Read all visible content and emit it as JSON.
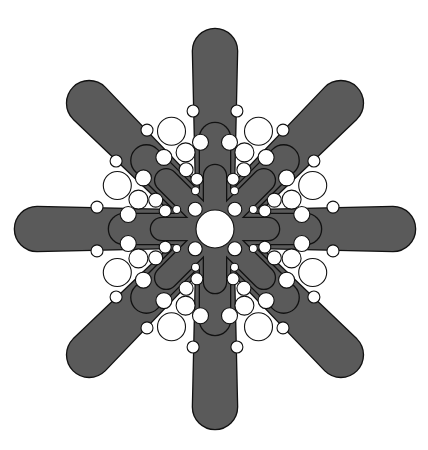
{
  "figure": {
    "title": "Eight-armed star with nested loops and white circle packing",
    "width": 428,
    "height": 450,
    "center": [
      215,
      229
    ],
    "colors": {
      "background": "#ffffff",
      "arm_fill": "#5a5a5a",
      "outline": "#111111",
      "circle_fill": "#ffffff"
    },
    "levels": [
      {
        "name": "outer-arms",
        "axial_length": 200,
        "diagonal_length": 200,
        "tip_width": 44,
        "base_width": 36
      },
      {
        "name": "middle-loops",
        "axial_length": 106,
        "diagonal_length": 112,
        "tip_width": 30,
        "base_width": 30
      },
      {
        "name": "inner-loops",
        "axial_length": 64,
        "diagonal_length": 80,
        "tip_width": 22,
        "base_width": 22
      }
    ],
    "center_circle": {
      "r": 19
    },
    "inner_ring": {
      "d": 28,
      "r": 7
    },
    "gap_chain": [
      {
        "d": 107,
        "da": 1.5,
        "r": 14
      },
      {
        "d": 82,
        "da": -1.5,
        "r": 9.5
      },
      {
        "d": 66,
        "da": 3.5,
        "r": 7
      },
      {
        "d": 53,
        "da": -2.5,
        "r": 6
      },
      {
        "d": 43,
        "da": 4.5,
        "r": 4
      }
    ],
    "side_chain": [
      {
        "d": 88,
        "da": 13,
        "r": 8
      },
      {
        "d": 88,
        "da": -13,
        "r": 8
      },
      {
        "d": 120,
        "da": 12,
        "r": 6
      },
      {
        "d": 120,
        "da": -12,
        "r": 6
      }
    ]
  }
}
